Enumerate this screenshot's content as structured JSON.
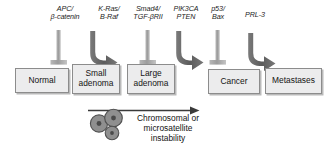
{
  "figure": {
    "background_color": "#ffffff",
    "box_fill": "#ececed",
    "box_border": "#8c8c8c",
    "connector_color": "#9a9a9a",
    "arrow_color": "#5e5e5e",
    "cell_fill": "#909090",
    "cell_border": "#4a4a4a"
  },
  "genes": [
    {
      "id": "apc",
      "text": "APC/\nβ-catenin"
    },
    {
      "id": "kras",
      "text": "K-Ras/\nB-Raf"
    },
    {
      "id": "smad4",
      "text": "Smad4/\nTGF-βRII"
    },
    {
      "id": "pik3ca",
      "text": "PIK3CA\nPTEN"
    },
    {
      "id": "p53",
      "text": "p53/\nBax"
    },
    {
      "id": "prl3",
      "text": "PRL-3"
    }
  ],
  "stages": [
    {
      "id": "normal",
      "label": "Normal"
    },
    {
      "id": "small-adenoma",
      "label": "Small\nadenoma"
    },
    {
      "id": "large-adenoma",
      "label": "Large\nadenoma"
    },
    {
      "id": "cancer",
      "label": "Cancer"
    },
    {
      "id": "metastases",
      "label": "Metastases"
    }
  ],
  "instability": {
    "caption": "Chromosomal or\nmicrosatellite\ninstability",
    "cell_count": 3
  }
}
